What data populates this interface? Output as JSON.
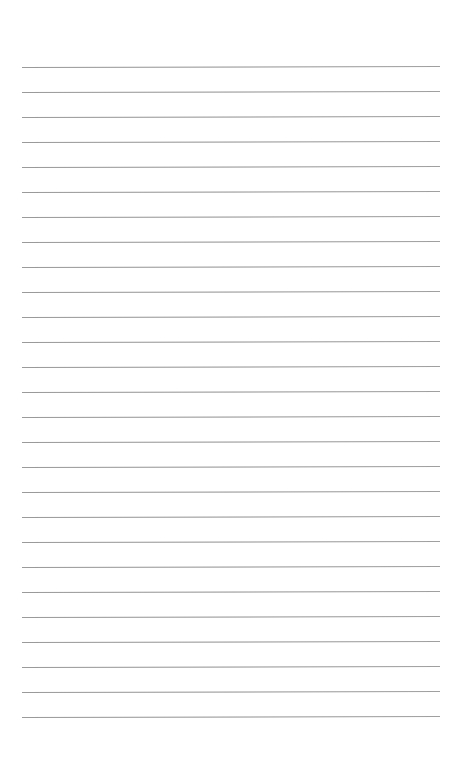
{
  "page": {
    "type": "lined-paper",
    "line_count": 27,
    "first_line_y": 67,
    "line_spacing": 25,
    "line_left": 22,
    "line_right": 440,
    "line_color": "#8e8e8e",
    "background_color": "#ffffff"
  }
}
